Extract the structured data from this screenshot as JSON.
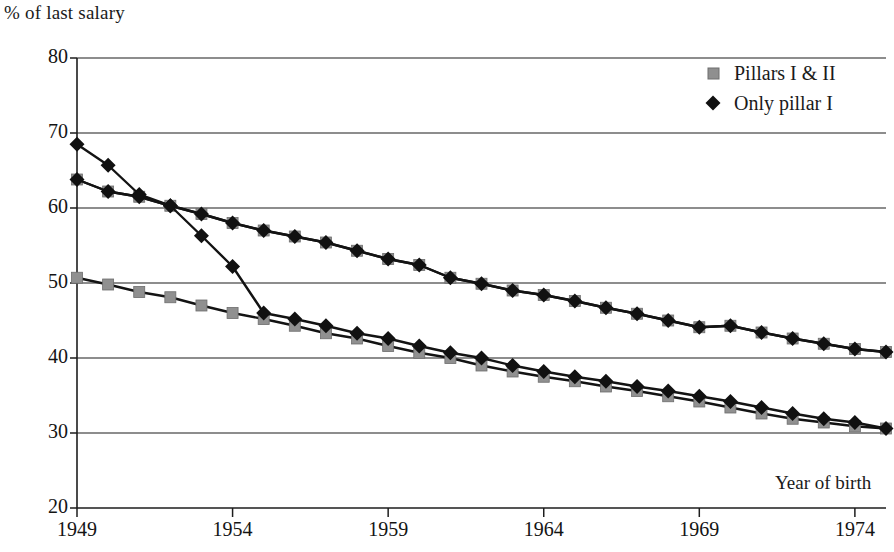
{
  "chart_data": {
    "type": "line",
    "title": "",
    "xlabel": "Year of birth",
    "ylabel": "% of last salary",
    "xlim": [
      1949,
      1975
    ],
    "ylim": [
      20,
      80
    ],
    "xticks": [
      1949,
      1954,
      1959,
      1964,
      1969,
      1974
    ],
    "yticks": [
      20,
      30,
      40,
      50,
      60,
      70,
      80
    ],
    "grid": true,
    "legend_position": "top-right",
    "x": [
      1949,
      1950,
      1951,
      1952,
      1953,
      1954,
      1955,
      1956,
      1957,
      1958,
      1959,
      1960,
      1961,
      1962,
      1963,
      1964,
      1965,
      1966,
      1967,
      1968,
      1969,
      1970,
      1971,
      1972,
      1973,
      1974,
      1975
    ],
    "series": [
      {
        "name": "Pillars I & II",
        "marker": "square",
        "color": "#8a8a8a",
        "values": [
          63.8,
          62.2,
          61.5,
          60.3,
          59.2,
          58.0,
          57.0,
          56.2,
          55.4,
          54.3,
          53.2,
          52.4,
          50.7,
          49.9,
          49.0,
          48.4,
          47.6,
          46.7,
          45.9,
          45.0,
          44.1,
          44.3,
          43.4,
          42.6,
          41.9,
          41.2,
          40.8
        ]
      },
      {
        "name": "Only pillar I",
        "marker": "diamond",
        "color": "#111111",
        "values": [
          68.5,
          65.7,
          61.8,
          60.3,
          56.3,
          52.2,
          46.0,
          45.2,
          44.3,
          43.3,
          42.6,
          41.6,
          40.7,
          40.0,
          39.0,
          38.2,
          37.5,
          36.9,
          36.2,
          35.6,
          34.9,
          34.2,
          33.4,
          32.6,
          31.9,
          31.4,
          30.6
        ]
      },
      {
        "name": "Pillars I & II lower branch",
        "marker": "square",
        "color": "#8a8a8a",
        "values": [
          50.7,
          49.8,
          48.8,
          48.1,
          47.0,
          46.0,
          45.2,
          44.3,
          43.3,
          42.6,
          41.6,
          40.7,
          40.0,
          39.0,
          38.2,
          37.5,
          36.9,
          36.2,
          35.6,
          34.9,
          34.2,
          33.4,
          32.6,
          31.9,
          31.4,
          30.9,
          30.6
        ]
      },
      {
        "name": "Only pillar I upper branch",
        "marker": "diamond",
        "color": "#111111",
        "values": [
          63.8,
          62.2,
          61.5,
          60.3,
          59.2,
          58.0,
          57.0,
          56.2,
          55.4,
          54.3,
          53.2,
          52.4,
          50.7,
          49.9,
          49.0,
          48.4,
          47.6,
          46.7,
          45.9,
          45.0,
          44.1,
          44.3,
          43.4,
          42.6,
          41.9,
          41.2,
          40.8
        ]
      }
    ]
  },
  "axis": {
    "ylabel": "% of last salary",
    "xlabel": "Year of birth",
    "ytick_labels": [
      "80",
      "70",
      "60",
      "50",
      "40",
      "30",
      "20"
    ],
    "xtick_labels": [
      "1949",
      "1954",
      "1959",
      "1964",
      "1969",
      "1974"
    ]
  },
  "legend": {
    "items": [
      {
        "label": "Pillars I & II",
        "marker": "square-marker",
        "color": "#8a8a8a"
      },
      {
        "label": "Only pillar I",
        "marker": "diamond-marker",
        "color": "#111111"
      }
    ]
  }
}
